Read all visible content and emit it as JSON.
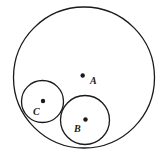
{
  "diagram": {
    "circles": [
      {
        "name": "A",
        "label": "A"
      },
      {
        "name": "B",
        "label": "B"
      },
      {
        "name": "C",
        "label": "C"
      }
    ],
    "stroke_color": "#1a1a1a"
  }
}
